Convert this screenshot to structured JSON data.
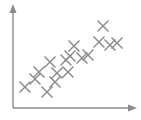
{
  "figure": {
    "name": "scatter-plot",
    "width": 141,
    "height": 120,
    "background_color": "#ffffff",
    "marker_color": "#8c8c8c",
    "axis_color": "#8a8a8a",
    "title": "",
    "has_gridlines": false,
    "has_tick_labels": false,
    "has_legend": false
  },
  "axes": {
    "origin_x": 13,
    "origin_y": 108,
    "y_axis_top": 6,
    "x_axis_right": 136,
    "y_arrow_name": "y-axis-arrowhead",
    "x_arrow_name": "x-axis-arrowhead",
    "x_label": "",
    "y_label": ""
  },
  "chart_data": {
    "type": "scatter",
    "title": "",
    "xlabel": "",
    "ylabel": "",
    "xlim": [
      0,
      100
    ],
    "ylim": [
      0,
      100
    ],
    "grid": false,
    "legend": null,
    "marker": "x",
    "marker_color": "#8c8c8c",
    "marker_size_px": 11,
    "series": [
      {
        "name": "",
        "points": [
          {
            "px": 25,
            "py": 87,
            "x": 10,
            "y": 21
          },
          {
            "px": 35,
            "py": 79,
            "x": 18,
            "y": 28
          },
          {
            "px": 39,
            "py": 72,
            "x": 21,
            "y": 35
          },
          {
            "px": 47,
            "py": 92,
            "x": 28,
            "y": 16
          },
          {
            "px": 50,
            "py": 62,
            "x": 30,
            "y": 45
          },
          {
            "px": 55,
            "py": 82,
            "x": 34,
            "y": 26
          },
          {
            "px": 57,
            "py": 73,
            "x": 36,
            "y": 34
          },
          {
            "px": 66,
            "py": 60,
            "x": 43,
            "y": 47
          },
          {
            "px": 68,
            "py": 72,
            "x": 45,
            "y": 35
          },
          {
            "px": 70,
            "py": 56,
            "x": 46,
            "y": 51
          },
          {
            "px": 74,
            "py": 46,
            "x": 50,
            "y": 61
          },
          {
            "px": 82,
            "py": 58,
            "x": 56,
            "y": 49
          },
          {
            "px": 88,
            "py": 55,
            "x": 61,
            "y": 52
          },
          {
            "px": 99,
            "py": 42,
            "x": 70,
            "y": 65
          },
          {
            "px": 103,
            "py": 26,
            "x": 73,
            "y": 80
          },
          {
            "px": 110,
            "py": 45,
            "x": 79,
            "y": 62
          },
          {
            "px": 117,
            "py": 43,
            "x": 85,
            "y": 64
          }
        ]
      }
    ]
  }
}
